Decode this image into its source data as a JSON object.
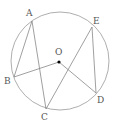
{
  "diagram": {
    "type": "circle-geometry",
    "circle": {
      "cx": 60,
      "cy": 61,
      "r": 49,
      "center_label": "O"
    },
    "points": {
      "A": {
        "x": 32,
        "y": 21,
        "label": "A",
        "lx": 26,
        "ly": 16
      },
      "E": {
        "x": 92,
        "y": 27,
        "label": "E",
        "lx": 93,
        "ly": 24
      },
      "B": {
        "x": 14,
        "y": 77,
        "label": "B",
        "lx": 4,
        "ly": 84
      },
      "C": {
        "x": 46,
        "y": 109,
        "label": "C",
        "lx": 41,
        "ly": 120
      },
      "D": {
        "x": 96,
        "y": 93,
        "label": "D",
        "lx": 97,
        "ly": 103
      },
      "O": {
        "x": 59,
        "y": 62,
        "label": "O",
        "lx": 55,
        "ly": 55
      }
    },
    "segments": [
      [
        "A",
        "B"
      ],
      [
        "A",
        "C"
      ],
      [
        "B",
        "O"
      ],
      [
        "O",
        "D"
      ],
      [
        "E",
        "C"
      ],
      [
        "E",
        "D"
      ]
    ],
    "colors": {
      "line": "#888888",
      "circle": "#999999",
      "dot": "#000000",
      "label": "#555555"
    }
  }
}
